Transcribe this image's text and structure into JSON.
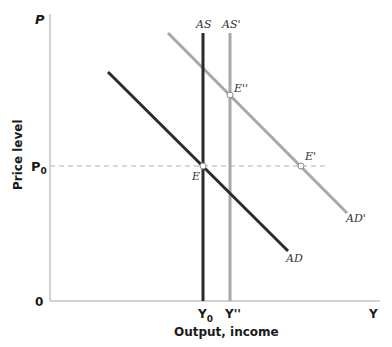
{
  "axes": {
    "y_label": "Price level",
    "y_symbol": "P",
    "x_label": "Output, income",
    "x_symbol": "Y",
    "origin": "0",
    "p0_label": "P",
    "p0_sub": "0",
    "y0_label": "Y",
    "y0_sub": "0",
    "y_double_prime": "Y''"
  },
  "curves": {
    "as": "AS",
    "as_prime": "AS'",
    "ad": "AD",
    "ad_prime": "AD'"
  },
  "points": {
    "e": "E",
    "e_prime": "E'",
    "e_double_prime": "E''"
  },
  "colors": {
    "dark_curve": "#2b2b2b",
    "light_curve": "#a8a8a8",
    "axis": "#bdbdbd",
    "dashed": "#b0b0b0"
  }
}
